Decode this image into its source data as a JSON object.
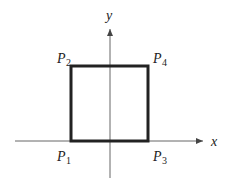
{
  "diagram": {
    "type": "coordinate-plane-square",
    "axes": {
      "x_label": "x",
      "y_label": "y"
    },
    "points": [
      {
        "name": "P",
        "sub": "1",
        "position": "bottom-left"
      },
      {
        "name": "P",
        "sub": "2",
        "position": "top-left"
      },
      {
        "name": "P",
        "sub": "3",
        "position": "bottom-right"
      },
      {
        "name": "P",
        "sub": "4",
        "position": "top-right"
      }
    ],
    "colors": {
      "axis": "#555555",
      "square": "#222222",
      "background": "#ffffff"
    }
  }
}
